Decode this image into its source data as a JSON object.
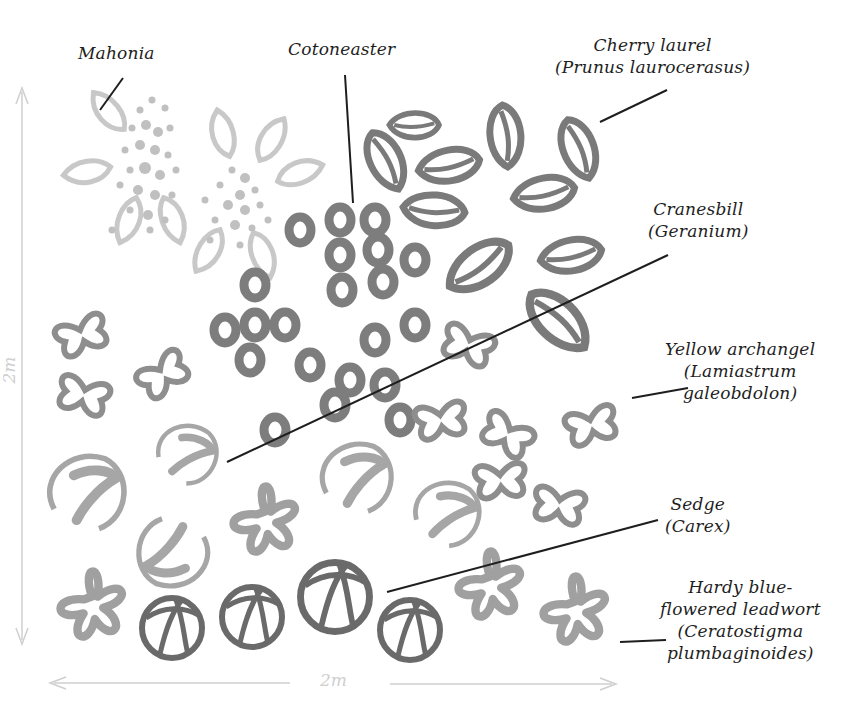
{
  "diagram": {
    "dimensions": {
      "width_label": "2m",
      "height_label": "2m"
    },
    "colors": {
      "leader_line": "#1e1e1e",
      "mahonia": "#c8c8c8",
      "cotoneaster": "#7d7d7d",
      "cherry_laurel": "#7a7a7a",
      "geranium": "#a6a6a6",
      "lamiastrum": "#8e8e8e",
      "carex": "#6a6a6a",
      "ceratostigma": "#a0a0a0",
      "dimension_arrow": "#cfcfcf"
    },
    "labels": [
      {
        "id": "mahonia",
        "lines": [
          "Mahonia"
        ]
      },
      {
        "id": "cotoneaster",
        "lines": [
          "Cotoneaster"
        ]
      },
      {
        "id": "cherry-laurel",
        "lines": [
          "Cherry laurel",
          "(Prunus laurocerasus)"
        ]
      },
      {
        "id": "cranesbill",
        "lines": [
          "Cranesbill",
          "(Geranium)"
        ]
      },
      {
        "id": "yellow-archangel",
        "lines": [
          "Yellow archangel",
          "(Lamiastrum",
          "galeobdolon)"
        ]
      },
      {
        "id": "sedge",
        "lines": [
          "Sedge",
          "(Carex)"
        ]
      },
      {
        "id": "leadwort",
        "lines": [
          "Hardy blue-",
          "flowered leadwort",
          "(Ceratostigma",
          "plumbaginoides)"
        ]
      }
    ]
  }
}
